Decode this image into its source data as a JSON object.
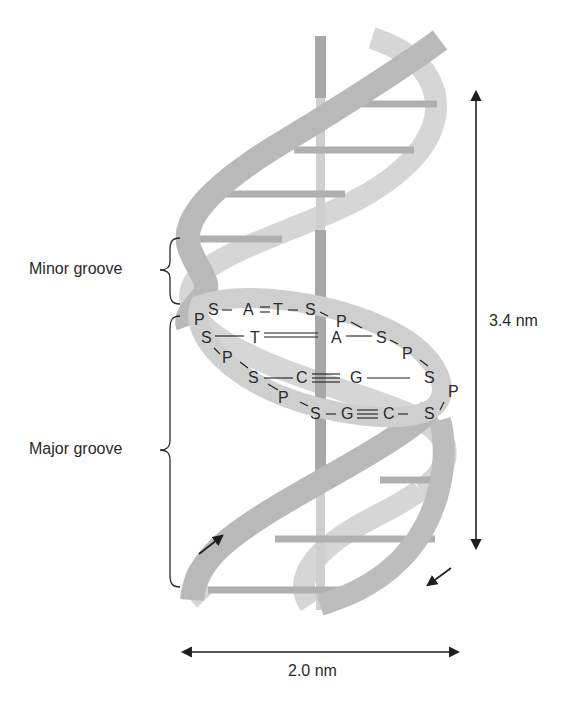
{
  "figure": {
    "labels": {
      "minor_groove": "Minor groove",
      "major_groove": "Major groove",
      "pitch": "3.4 nm",
      "diameter": "2.0 nm"
    },
    "base_pairs": [
      {
        "row": 1,
        "text": [
          "P",
          "S",
          "–",
          "A",
          "=",
          "T",
          "–",
          "S",
          "P"
        ]
      },
      {
        "row": 2,
        "text": [
          "S",
          "—",
          "T",
          "≡",
          "A",
          "—",
          "S",
          "P"
        ]
      },
      {
        "row": 3,
        "text": [
          "S",
          "P",
          "S",
          "—",
          "C",
          "≡",
          "G",
          "—",
          "S",
          "P"
        ]
      },
      {
        "row": 4,
        "text": [
          "P",
          "S",
          "—",
          "G",
          "≡",
          "C",
          "–",
          "S"
        ]
      }
    ],
    "glyphs": {
      "P": "P",
      "S": "S",
      "A": "A",
      "T": "T",
      "C": "C",
      "G": "G"
    },
    "colors": {
      "front_strand": "#b9b9b9",
      "back_strand": "#d6d6d6",
      "axis_front": "#a8a8a8",
      "axis_back": "#cfcfcf",
      "rungs": "#b0b0b0",
      "ink": "#1e1e1e"
    }
  }
}
